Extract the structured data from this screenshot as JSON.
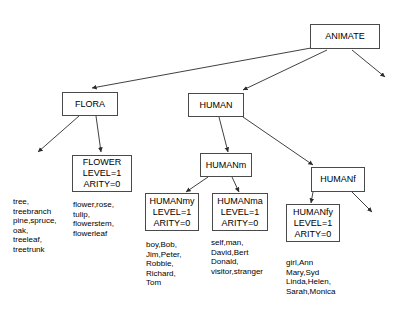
{
  "diagram": {
    "nodes": {
      "animate": {
        "label": "ANIMATE"
      },
      "flora": {
        "label": "FLORA"
      },
      "human": {
        "label": "HUMAN"
      },
      "flower": {
        "label": "FLOWER",
        "level": "LEVEL=1",
        "arity": "ARITY=0"
      },
      "humanm": {
        "label": "HUMANm"
      },
      "humanf": {
        "label": "HUMANf"
      },
      "humanmy": {
        "label": "HUMANmy",
        "level": "LEVEL=1",
        "arity": "ARITY=0"
      },
      "humanma": {
        "label": "HUMANma",
        "level": "LEVEL=1",
        "arity": "ARITY=0"
      },
      "humanfy": {
        "label": "HUMANfy",
        "level": "LEVEL=1",
        "arity": "ARITY=0"
      }
    },
    "leaf_lists": {
      "tree": "tree,\ntreebranch\npine,spruce,\noak,\ntreeleaf,\ntreetrunk",
      "flower": "flower,rose,\ntulip,\nflowerstem,\nflowerleaf",
      "humanmy": "boy,Bob,\nJim,Peter,\nRobbie,\nRichard,\nTom",
      "humanma": "self,man,\nDavid,Bert\nDonald,\nvisitor,stranger",
      "humanfy": "girl,Ann\nMary,Syd\nLinda,Helen,\nSarah,Monica"
    },
    "colors": {
      "stroke": "#4a4a4a",
      "edge": "#2b2b2b",
      "text": "#000000",
      "background": "#ffffff"
    }
  }
}
